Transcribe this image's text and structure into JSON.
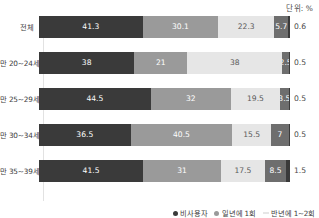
{
  "unit_caption": "단위: %",
  "legend": {
    "items": [
      {
        "label": "비사용자",
        "color": "#3a3a3a",
        "marker": "dot"
      },
      {
        "label": "일년에 1회",
        "color": "#9a9a9a",
        "marker": "dot"
      },
      {
        "label": "반년에 1~2회",
        "color": "#e6e6e6",
        "marker": "dash"
      }
    ]
  },
  "chart_data": {
    "type": "bar",
    "orientation": "horizontal",
    "stacked": true,
    "stack_percent": true,
    "title": "",
    "xlabel": "",
    "ylabel": "",
    "unit": "%",
    "grid": false,
    "legend_position": "bottom-right",
    "xlim": [
      0,
      100
    ],
    "categories": [
      "전체",
      "만 20~24세",
      "만 25~29세",
      "만 30~34세",
      "만 35~39세"
    ],
    "series": [
      {
        "name": "세그먼트1",
        "color": "#3a3a3a",
        "values": [
          41.3,
          38,
          44.5,
          36.5,
          41.5
        ]
      },
      {
        "name": "세그먼트2",
        "color": "#9a9a9a",
        "values": [
          30.1,
          21,
          32,
          40.5,
          31
        ]
      },
      {
        "name": "세그먼트3",
        "color": "#e6e6e6",
        "values": [
          22.3,
          38,
          19.5,
          15.5,
          17.5
        ]
      },
      {
        "name": "세그먼트4",
        "color": "#6e6e6e",
        "values": [
          5.7,
          2.5,
          3.5,
          7,
          8.5
        ]
      },
      {
        "name": "세그먼트5",
        "color": "#3a3a3a",
        "values": [
          0.6,
          0.5,
          0.5,
          0.5,
          1.5
        ]
      }
    ],
    "rows": [
      {
        "label": "전체",
        "segments": [
          {
            "value": "41.3",
            "pct": 41.3,
            "style": "seg-0",
            "show": true
          },
          {
            "value": "30.1",
            "pct": 30.1,
            "style": "seg-1",
            "show": true
          },
          {
            "value": "22.3",
            "pct": 22.3,
            "style": "seg-2",
            "show": true
          },
          {
            "value": "5.7",
            "pct": 5.7,
            "style": "seg-3",
            "show": true
          },
          {
            "value": "0.6",
            "pct": 0.6,
            "style": "seg-4",
            "show": false
          }
        ],
        "outside_label": "0.6"
      },
      {
        "label": "만 20~24세",
        "segments": [
          {
            "value": "38",
            "pct": 38,
            "style": "seg-0",
            "show": true
          },
          {
            "value": "21",
            "pct": 21,
            "style": "seg-1",
            "show": true
          },
          {
            "value": "38",
            "pct": 38,
            "style": "seg-2",
            "show": true
          },
          {
            "value": "2.5",
            "pct": 2.5,
            "style": "seg-3",
            "show": true
          },
          {
            "value": "0.5",
            "pct": 0.5,
            "style": "seg-4",
            "show": false
          }
        ],
        "outside_label": "0.5"
      },
      {
        "label": "만 25~29세",
        "segments": [
          {
            "value": "44.5",
            "pct": 44.5,
            "style": "seg-0",
            "show": true
          },
          {
            "value": "32",
            "pct": 32,
            "style": "seg-1",
            "show": true
          },
          {
            "value": "19.5",
            "pct": 19.5,
            "style": "seg-2",
            "show": true
          },
          {
            "value": "3.5",
            "pct": 3.5,
            "style": "seg-3",
            "show": true
          },
          {
            "value": "0.5",
            "pct": 0.5,
            "style": "seg-4",
            "show": false
          }
        ],
        "outside_label": "0.5"
      },
      {
        "label": "만 30~34세",
        "segments": [
          {
            "value": "36.5",
            "pct": 36.5,
            "style": "seg-0",
            "show": true
          },
          {
            "value": "40.5",
            "pct": 40.5,
            "style": "seg-1",
            "show": true
          },
          {
            "value": "15.5",
            "pct": 15.5,
            "style": "seg-2",
            "show": true
          },
          {
            "value": "7",
            "pct": 7,
            "style": "seg-3",
            "show": true
          },
          {
            "value": "0.5",
            "pct": 0.5,
            "style": "seg-4",
            "show": false
          }
        ],
        "outside_label": "0.5"
      },
      {
        "label": "만 35~39세",
        "segments": [
          {
            "value": "41.5",
            "pct": 41.5,
            "style": "seg-0",
            "show": true
          },
          {
            "value": "31",
            "pct": 31,
            "style": "seg-1",
            "show": true
          },
          {
            "value": "17.5",
            "pct": 17.5,
            "style": "seg-2",
            "show": true
          },
          {
            "value": "8.5",
            "pct": 8.5,
            "style": "seg-3",
            "show": true
          },
          {
            "value": "1.5",
            "pct": 1.5,
            "style": "seg-4",
            "show": false
          }
        ],
        "outside_label": "1.5"
      }
    ]
  }
}
